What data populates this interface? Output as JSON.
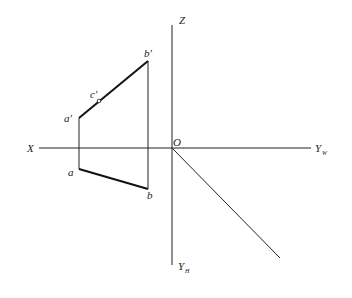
{
  "diagram": {
    "type": "orthographic-projection",
    "axes": {
      "x_label": "X",
      "z_label": "Z",
      "origin_label": "O",
      "yw_label": "Y",
      "yw_sub": "W",
      "yh_label": "Y",
      "yh_sub": "H"
    },
    "points": {
      "a_prime": "a'",
      "b_prime": "b'",
      "c_prime": "c'",
      "a": "a",
      "b": "b"
    },
    "colors": {
      "line": "#222222",
      "background": "#ffffff"
    }
  }
}
